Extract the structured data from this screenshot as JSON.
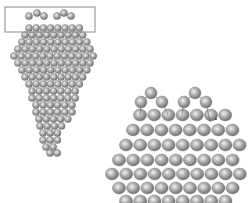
{
  "figure": {
    "colors": {
      "background": "#ffffff",
      "atom_light": "#e6e6e6",
      "atom_mid": "#a8a8a8",
      "atom_dark": "#6e6e6e",
      "outline": "#808080",
      "bond": "#555555"
    },
    "left_panel": {
      "highlight_box": {
        "x": 5,
        "y": 7,
        "w": 90,
        "h": 25
      },
      "atom_radius": 3.6,
      "spacing": 7.2,
      "top_adatoms": [
        {
          "cx": 29,
          "cy": 16
        },
        {
          "cx": 37,
          "cy": 13
        },
        {
          "cx": 44,
          "cy": 16
        },
        {
          "cx": 57,
          "cy": 16
        },
        {
          "cx": 64,
          "cy": 13
        },
        {
          "cx": 71,
          "cy": 16
        }
      ],
      "rows": [
        {
          "y": 24,
          "x_start": 25,
          "count": 8
        },
        {
          "y": 31,
          "x_start": 21,
          "count": 9
        },
        {
          "y": 38,
          "x_start": 18,
          "count": 10
        },
        {
          "y": 45,
          "x_start": 14,
          "count": 11
        },
        {
          "y": 52,
          "x_start": 10,
          "count": 12
        },
        {
          "y": 59,
          "x_start": 14,
          "count": 11
        },
        {
          "y": 66,
          "x_start": 18,
          "count": 10
        },
        {
          "y": 73,
          "x_start": 21,
          "count": 9
        },
        {
          "y": 80,
          "x_start": 25,
          "count": 8
        },
        {
          "y": 87,
          "x_start": 28,
          "count": 7
        },
        {
          "y": 94,
          "x_start": 28,
          "count": 7
        },
        {
          "y": 101,
          "x_start": 32,
          "count": 6
        },
        {
          "y": 108,
          "x_start": 32,
          "count": 6
        },
        {
          "y": 115,
          "x_start": 35,
          "count": 5
        },
        {
          "y": 122,
          "x_start": 36,
          "count": 4
        },
        {
          "y": 129,
          "x_start": 39,
          "count": 3
        },
        {
          "y": 136,
          "x_start": 39,
          "count": 3
        },
        {
          "y": 143,
          "x_start": 42,
          "count": 2
        },
        {
          "y": 149,
          "x_start": 46,
          "count": 2
        }
      ]
    },
    "right_panel": {
      "atom_rx": 6.6,
      "atom_ry": 6.0,
      "spacing": 14.2,
      "top_adatoms": [
        {
          "cx": 141,
          "cy": 102
        },
        {
          "cx": 151,
          "cy": 93
        },
        {
          "cx": 162,
          "cy": 102
        },
        {
          "cx": 184,
          "cy": 102
        },
        {
          "cx": 195,
          "cy": 93
        },
        {
          "cx": 206,
          "cy": 102
        }
      ],
      "rows": [
        {
          "y": 115,
          "x_start": 140,
          "count": 7
        },
        {
          "y": 130,
          "x_start": 133,
          "count": 7
        },
        {
          "y": 145,
          "x_start": 126,
          "count": 8
        },
        {
          "y": 159,
          "x_start": 119,
          "count": 9
        },
        {
          "y": 163,
          "x_start": 0,
          "count": 0
        },
        {
          "y": 162,
          "x_start": 0,
          "count": 0
        }
      ],
      "rows_main": [
        {
          "y": 115,
          "x_start": 140,
          "count": 7
        },
        {
          "y": 130,
          "x_start": 133,
          "count": 8
        },
        {
          "y": 145,
          "x_start": 126,
          "count": 9
        },
        {
          "y": 160,
          "x_start": 119,
          "count": 9
        },
        {
          "y": 174,
          "x_start": 112,
          "count": 10
        },
        {
          "y": 188,
          "x_start": 119,
          "count": 9
        },
        {
          "y": 201,
          "x_start": 126,
          "count": 8
        }
      ],
      "marker_dot": {
        "cx": 216,
        "cy": 119
      }
    }
  }
}
